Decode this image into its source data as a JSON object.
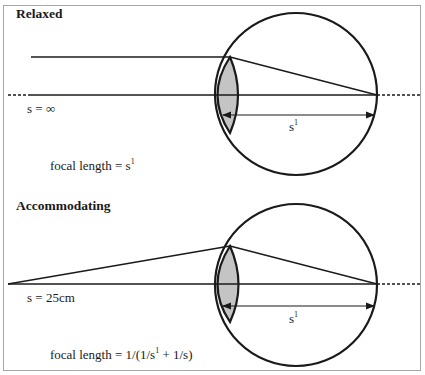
{
  "panels": [
    {
      "title": "Relaxed",
      "object_distance_label": "s = ∞",
      "image_distance_label": "s",
      "image_distance_sup": "1",
      "formula_prefix": "focal length = s",
      "formula_sup": "1",
      "formula_suffix": ""
    },
    {
      "title": "Accommodating",
      "object_distance_label": "s = 25cm",
      "image_distance_label": "s",
      "image_distance_sup": "1",
      "formula_prefix": "focal length = 1/(1/s",
      "formula_sup": "1",
      "formula_suffix": " + 1/s)"
    }
  ],
  "colors": {
    "line": "#1a1a1a",
    "lens_fill": "#c4c4c4",
    "frame": "#a8a8a8"
  }
}
